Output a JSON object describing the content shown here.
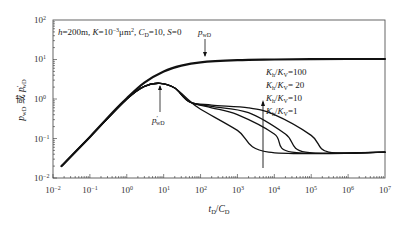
{
  "chart_data": {
    "type": "line",
    "scale": {
      "x": "log",
      "y": "log"
    },
    "xlabel": "t_D/C_D",
    "ylabel": "p_wD 或 p'_wD",
    "xlim": [
      0.01,
      10000000
    ],
    "ylim": [
      0.01,
      100
    ],
    "x_ticks": [
      "10^-2",
      "10^-1",
      "10^0",
      "10^1",
      "10^2",
      "10^3",
      "10^4",
      "10^5",
      "10^6",
      "10^7"
    ],
    "y_ticks": [
      "10^-2",
      "10^-1",
      "10^0",
      "10^1",
      "10^2"
    ],
    "grid": false,
    "annotation": "h=200m, K=10^-3μm², C_D=10, S=0",
    "curve_labels": {
      "pressure": "p_wD",
      "derivative": "p'_wD"
    },
    "legend": {
      "position": "inside-right",
      "entries": [
        "K_h/K_V=100",
        "K_h/K_V=20",
        "K_h/K_V=10",
        "K_h/K_V=1"
      ],
      "arrow": "increasing upward"
    },
    "series": [
      {
        "name": "p_wD (all K_h/K_V)",
        "x": [
          0.017,
          0.1,
          0.5,
          1,
          3,
          10,
          30,
          100,
          1000,
          10000,
          100000,
          1000000,
          10000000
        ],
        "y": [
          0.02,
          0.11,
          0.55,
          1.05,
          2.6,
          5.0,
          7.0,
          8.5,
          9.6,
          10.0,
          10.2,
          10.3,
          10.3
        ]
      },
      {
        "name": "p'_wD K_h/K_V=1",
        "x": [
          0.017,
          0.1,
          1,
          3,
          8,
          20,
          50,
          100,
          1000,
          7000,
          10000000
        ],
        "y": [
          0.02,
          0.11,
          1.0,
          2.1,
          2.5,
          1.9,
          0.9,
          0.55,
          0.16,
          0.045,
          0.045
        ]
      },
      {
        "name": "p'_wD K_h/K_V=10",
        "x": [
          0.017,
          0.1,
          1,
          3,
          8,
          20,
          50,
          200,
          1000,
          10000,
          30000,
          10000000
        ],
        "y": [
          0.02,
          0.11,
          1.0,
          2.1,
          2.5,
          1.9,
          0.85,
          0.6,
          0.4,
          0.13,
          0.045,
          0.045
        ]
      },
      {
        "name": "p'_wD K_h/K_V=20",
        "x": [
          0.017,
          0.1,
          1,
          3,
          8,
          20,
          50,
          200,
          2000,
          20000,
          70000,
          10000000
        ],
        "y": [
          0.02,
          0.11,
          1.0,
          2.1,
          2.5,
          1.9,
          0.85,
          0.65,
          0.45,
          0.13,
          0.045,
          0.045
        ]
      },
      {
        "name": "p'_wD K_h/K_V=100",
        "x": [
          0.017,
          0.1,
          1,
          3,
          8,
          20,
          50,
          200,
          2000,
          10000,
          100000,
          300000,
          10000000
        ],
        "y": [
          0.02,
          0.11,
          1.0,
          2.1,
          2.5,
          1.9,
          0.85,
          0.7,
          0.6,
          0.4,
          0.12,
          0.045,
          0.045
        ]
      }
    ]
  },
  "labels": {
    "annotation_h": "h",
    "annotation_rest1": "=200m, ",
    "annotation_K": "K",
    "annotation_rest2": "=10",
    "annotation_exp": "−3",
    "annotation_rest3": "μm",
    "annotation_sq": "2",
    "annotation_rest4": ", ",
    "annotation_C": "C",
    "annotation_Csub": "D",
    "annotation_rest5": "=10, ",
    "annotation_S": "S",
    "annotation_rest6": "=0",
    "p_main": "p",
    "p_sub": "wD",
    "pd_main": "p",
    "pd_prime": "′",
    "x_title_t": "t",
    "x_title_tsub": "D",
    "x_title_slash": "/",
    "x_title_C": "C",
    "x_title_Csub": "D",
    "y_title_p1": "p",
    "y_title_p1sub": "wD",
    "y_title_or": " 或 ",
    "y_title_p2": "p",
    "y_title_p2prime": "′",
    "y_title_p2sub": "wD",
    "legend": [
      {
        "K": "K",
        "h": "h",
        "slash": "/",
        "K2": "K",
        "v": "V",
        "val": "=100"
      },
      {
        "K": "K",
        "h": "h",
        "slash": "/",
        "K2": "K",
        "v": "V",
        "val": "= 20"
      },
      {
        "K": "K",
        "h": "h",
        "slash": "/",
        "K2": "K",
        "v": "V",
        "val": "=10"
      },
      {
        "K": "K",
        "h": "h",
        "slash": "/",
        "K2": "K",
        "v": "V",
        "val": "=1"
      }
    ],
    "xticks": [
      {
        "b": "10",
        "e": "−2"
      },
      {
        "b": "10",
        "e": "−1"
      },
      {
        "b": "10",
        "e": "0"
      },
      {
        "b": "10",
        "e": "1"
      },
      {
        "b": "10",
        "e": "2"
      },
      {
        "b": "10",
        "e": "3"
      },
      {
        "b": "10",
        "e": "4"
      },
      {
        "b": "10",
        "e": "5"
      },
      {
        "b": "10",
        "e": "6"
      },
      {
        "b": "10",
        "e": "7"
      }
    ],
    "yticks": [
      {
        "b": "10",
        "e": "2"
      },
      {
        "b": "10",
        "e": "1"
      },
      {
        "b": "10",
        "e": "0"
      },
      {
        "b": "10",
        "e": "−1"
      },
      {
        "b": "10",
        "e": "−2"
      }
    ]
  }
}
